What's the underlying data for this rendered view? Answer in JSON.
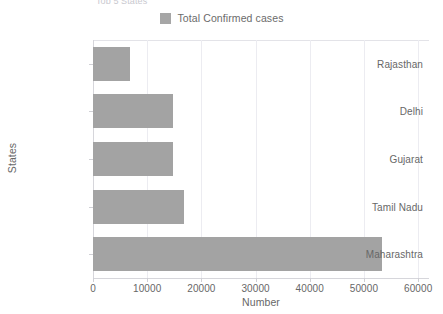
{
  "chart_data": {
    "type": "bar",
    "orientation": "horizontal",
    "title": "Top 5 States",
    "xlabel": "Number",
    "ylabel": "States",
    "categories": [
      "Maharashtra",
      "Tamil Nadu",
      "Gujarat",
      "Delhi",
      "Rajasthan"
    ],
    "values": [
      53300,
      16700,
      14700,
      14700,
      6750
    ],
    "series": [
      {
        "name": "Total Confirmed cases",
        "color": "#a3a3a3",
        "values": [
          53300,
          16700,
          14700,
          14700,
          6750
        ]
      }
    ],
    "xlim": [
      0,
      62000
    ],
    "xticks": [
      0,
      10000,
      20000,
      30000,
      40000,
      50000,
      60000
    ],
    "xtick_labels": [
      "0",
      "10000",
      "20000",
      "30000",
      "40000",
      "50000",
      "60000"
    ],
    "grid": true,
    "grid_axis": "x",
    "legend": [
      "Total Confirmed cases"
    ],
    "legend_position": "top-center"
  },
  "legend": {
    "label": "Total Confirmed cases",
    "swatch_color": "#a6a6a6"
  },
  "axes": {
    "x_title": "Number",
    "y_title": "States"
  }
}
